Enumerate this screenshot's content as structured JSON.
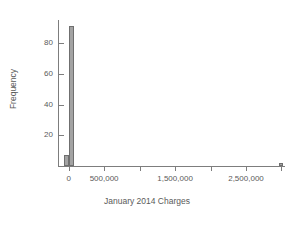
{
  "chart_data": {
    "type": "bar",
    "title": "",
    "subtitle": "",
    "xlabel": "January 2014 Charges",
    "ylabel": "Frequency",
    "grid": false,
    "legend": "none",
    "xlim": [
      -150000,
      3050000
    ],
    "ylim": [
      0,
      95
    ],
    "x_ticks": [
      0,
      500000,
      1000000,
      1500000,
      2000000,
      2500000,
      3000000
    ],
    "x_tick_labels": [
      "0",
      "500,000",
      "",
      "1,500,000",
      "",
      "2,500,000",
      ""
    ],
    "y_ticks": [
      20,
      40,
      60,
      80
    ],
    "y_tick_labels": [
      "20",
      "40",
      "60",
      "80"
    ],
    "bin_width": 60000,
    "bars": [
      {
        "x": -60000,
        "value": 7,
        "label": "bin--60000"
      },
      {
        "x": 10000,
        "value": 91,
        "label": "bin-0"
      },
      {
        "x": 2960000,
        "value": 2,
        "label": "bin-2960000"
      }
    ],
    "categories": [
      "-60,000",
      "0",
      "2,960,000"
    ],
    "values": [
      7,
      91,
      2
    ]
  },
  "style": {
    "axis_color": "#7d7d7d",
    "text_color": "#5a5a5a",
    "bar_fill": "#a3a3a3",
    "bar_edge": "#6f6f6f",
    "background": "#ffffff"
  }
}
